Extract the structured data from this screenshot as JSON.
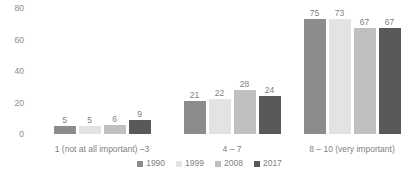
{
  "chart_data": {
    "type": "bar",
    "title": "",
    "subtitle": "",
    "xlabel": "",
    "ylabel": "",
    "ylim": [
      0,
      80
    ],
    "yticks": [
      0,
      20,
      40,
      60,
      80
    ],
    "grid": false,
    "legend_position": "bottom",
    "categories": [
      "1 (not at all important) –3",
      "4 – 7",
      "8 – 10 (very important)"
    ],
    "series": [
      {
        "name": "1990",
        "color": "#8c8c8c",
        "values": [
          5,
          21,
          75
        ]
      },
      {
        "name": "1999",
        "color": "#e3e3e3",
        "values": [
          5,
          22,
          73
        ]
      },
      {
        "name": "2008",
        "color": "#bfbfbf",
        "values": [
          6,
          28,
          67
        ]
      },
      {
        "name": "2017",
        "color": "#595959",
        "values": [
          9,
          24,
          67
        ]
      }
    ]
  }
}
